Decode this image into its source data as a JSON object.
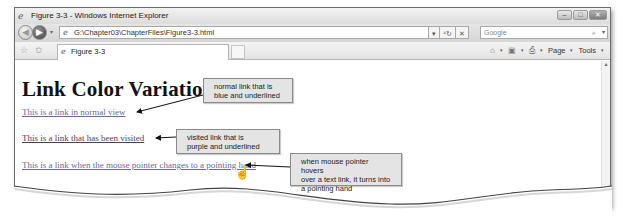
{
  "window": {
    "title": "Figure 3-3 - Windows Internet Explorer",
    "controls": {
      "minimize": "–",
      "maximize": "□",
      "close": "✕"
    }
  },
  "navbar": {
    "back_icon": "◀",
    "forward_icon": "▶",
    "dropdown_icon": "▾",
    "address": "G:\\Chapter03\\ChapterFiles\\Figure3-3.html",
    "address_dropdown": "▾",
    "refresh_icon": "⁴↻",
    "stop_icon": "✕",
    "search_placeholder": "Google",
    "search_icon": "⌕",
    "search_dropdown": "▾"
  },
  "tabbar": {
    "favorites_icon": "☆",
    "add_favorites_icon": "✩",
    "tab_label": "Figure 3-3",
    "commands": {
      "home_icon": "⌂",
      "feeds_icon": "▣",
      "print_icon": "⎙",
      "page_label": "Page",
      "tools_label": "Tools",
      "dropdown": "▾"
    }
  },
  "page": {
    "heading": "Link Color Variation",
    "links": [
      {
        "text": "This is a link in normal view",
        "state": "normal"
      },
      {
        "text": "This is a link that has been visited",
        "state": "visited"
      },
      {
        "text": "This is a link when the mouse pointer changes to a pointing hand",
        "state": "hover"
      }
    ],
    "cursor_icon": "☝"
  },
  "callouts": [
    {
      "line1": "normal link that is",
      "line2": "blue and underlined"
    },
    {
      "line1": "visited link that is",
      "line2": "purple and underlined"
    },
    {
      "line1": "when  mouse pointer hovers",
      "line2": "over a text link, it turns into",
      "line3": "a pointing hand"
    }
  ],
  "colors": {
    "link_normal": "#6a6a9a",
    "link_visited": "#5a3a5a",
    "callout_bg": "#e4e4e4"
  }
}
